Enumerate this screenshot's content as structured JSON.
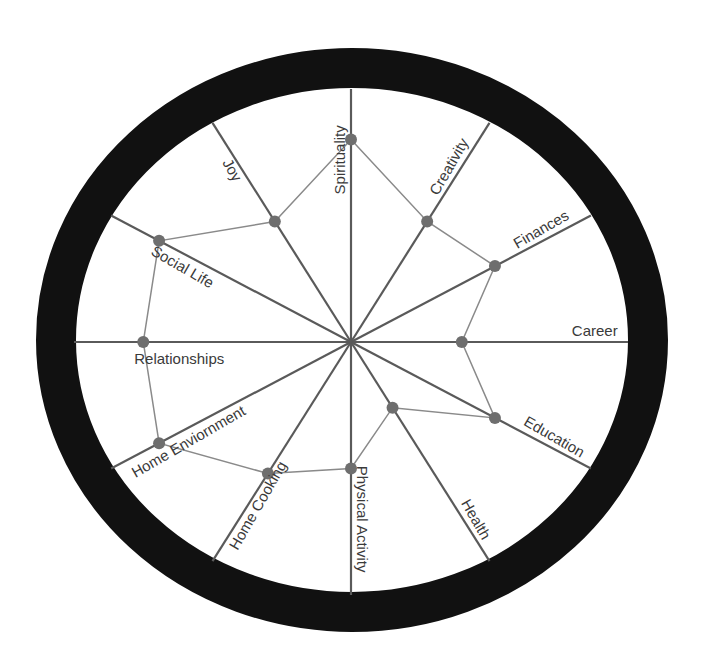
{
  "chart_data": {
    "type": "radar",
    "title": "",
    "style": "wheel-of-life",
    "scale_max": 10,
    "grid": false,
    "legend": null,
    "categories": [
      "Spirituality",
      "Creativity",
      "Finances",
      "Career",
      "Education",
      "Health",
      "Physical Activity",
      "Home Cooking",
      "Home Enviornment",
      "Relationships",
      "Social Life",
      "Joy"
    ],
    "series": [
      {
        "name": "Current",
        "values": [
          8,
          5.5,
          6,
          4,
          6,
          3,
          5,
          6,
          8,
          7.5,
          8,
          5.5
        ]
      }
    ],
    "colors": {
      "ring": "#111111",
      "spoke": "#5a5a5a",
      "polygon": "#8a8a8a",
      "marker": "#6e6e6e",
      "label": "#3a3a3a"
    }
  }
}
